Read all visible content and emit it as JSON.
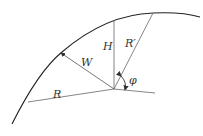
{
  "diagram": {
    "labels": {
      "H": "H",
      "R_prime": "R′",
      "W": "W",
      "R": "R",
      "phi": "φ"
    },
    "colors": {
      "curve": "#222222",
      "lines": "#555555",
      "text": "#333333"
    }
  }
}
